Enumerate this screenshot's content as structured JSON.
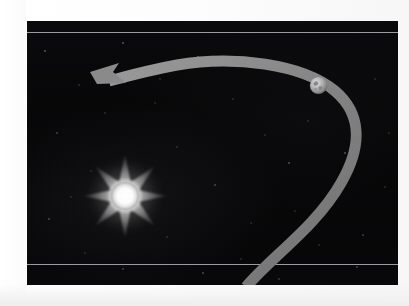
{
  "figure": {
    "type": "astronomy-illustration",
    "background_color": "#070708",
    "page_color": "#ffffff"
  },
  "panel": {
    "x": 27,
    "y": 21,
    "width": 371,
    "height": 264,
    "border_color": "#000000",
    "lines": [
      {
        "name": "upper-scan-line",
        "y": 32,
        "color": "#9c9ca0"
      },
      {
        "name": "lower-scan-line",
        "y": 264,
        "color": "#9c9ca0"
      }
    ]
  },
  "sun": {
    "label": "sun",
    "center_x": 125,
    "center_y": 196,
    "core_radius": 14,
    "ray_count": 8,
    "ray_length": 45,
    "core_color": "#ffffff",
    "glow_color": "#d8d8d8",
    "ray_color": "#8e8e8e"
  },
  "planet": {
    "label": "planet",
    "center_x": 318,
    "center_y": 85,
    "radius": 9,
    "body_color": "#b8b8b8",
    "shadow_color": "#5a5a5a",
    "marking_color": "#6e6e6e"
  },
  "orbit_arrow": {
    "label": "orbital direction arrow",
    "color": "#8a8a8a",
    "stroke_width": 11,
    "direction": "counter-clockwise",
    "arrowhead_x": 92,
    "arrowhead_y": 72,
    "arrowhead_direction": "left",
    "path_enters_at_x": 245,
    "path_enters_at_y": 285
  },
  "starfield": {
    "label": "star field",
    "density": "sparse",
    "star_color": "#e6e6ee"
  }
}
